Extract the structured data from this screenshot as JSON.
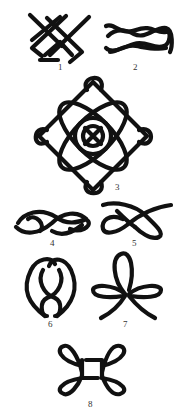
{
  "figure": {
    "ink_color": "#111111",
    "background_color": "#ffffff",
    "knots": [
      {
        "number": "1",
        "shape": "interlaced-square-lattice"
      },
      {
        "number": "2",
        "shape": "reef-knot-horizontal"
      },
      {
        "number": "3",
        "shape": "four-loop-rosette-with-circle"
      },
      {
        "number": "4",
        "shape": "figure-eight-horizontal"
      },
      {
        "number": "5",
        "shape": "overhand-loop"
      },
      {
        "number": "6",
        "shape": "double-loop-vertical"
      },
      {
        "number": "7",
        "shape": "three-loop-clover"
      },
      {
        "number": "8",
        "shape": "four-loop-square-knot"
      }
    ]
  }
}
